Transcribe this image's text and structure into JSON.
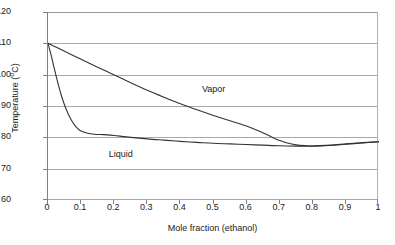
{
  "chart_data": {
    "type": "line",
    "title": "",
    "xlabel": "Mole fraction (ethanol)",
    "ylabel": "Temperature (°C)",
    "ylabel_text": "Temperature (",
    "ylabel_unit_sup": "o",
    "ylabel_tail": "C)",
    "xlim": [
      0,
      1
    ],
    "ylim": [
      60,
      120
    ],
    "grid": true,
    "legend_position": "inline-annotations",
    "xticks": [
      "0",
      "0.1",
      "0.2",
      "0.3",
      "0.4",
      "0.5",
      "0.6",
      "0.7",
      "0.8",
      "0.9",
      "1"
    ],
    "xtick_values": [
      0,
      0.1,
      0.2,
      0.3,
      0.4,
      0.5,
      0.6,
      0.7,
      0.8,
      0.9,
      1
    ],
    "yticks": [
      "60",
      "70",
      "80",
      "90",
      "100",
      "110",
      "120"
    ],
    "ytick_values": [
      60,
      70,
      80,
      90,
      100,
      110,
      120
    ],
    "annotations": [
      {
        "text": "Vapor",
        "x": 0.5,
        "y": 95
      },
      {
        "text": "Liquid",
        "x": 0.22,
        "y": 74.5
      }
    ],
    "series": [
      {
        "name": "Vapor",
        "color": "#333333",
        "x": [
          0.0,
          0.02,
          0.05,
          0.1,
          0.15,
          0.2,
          0.25,
          0.3,
          0.35,
          0.4,
          0.45,
          0.5,
          0.55,
          0.6,
          0.65,
          0.68,
          0.7,
          0.72,
          0.75,
          0.78,
          0.8,
          0.85,
          0.9,
          0.95,
          1.0
        ],
        "y": [
          110.0,
          109.0,
          107.5,
          104.9,
          102.4,
          99.9,
          97.4,
          95.0,
          92.8,
          90.7,
          88.8,
          87.0,
          85.3,
          83.6,
          81.4,
          79.9,
          79.0,
          78.3,
          77.6,
          77.3,
          77.2,
          77.4,
          77.8,
          78.2,
          78.6
        ]
      },
      {
        "name": "Liquid",
        "color": "#333333",
        "x": [
          0.0,
          0.01,
          0.02,
          0.03,
          0.04,
          0.05,
          0.06,
          0.07,
          0.08,
          0.09,
          0.1,
          0.12,
          0.14,
          0.16,
          0.18,
          0.2,
          0.25,
          0.3,
          0.35,
          0.4,
          0.45,
          0.5,
          0.55,
          0.6,
          0.65,
          0.7,
          0.75,
          0.78,
          0.8,
          0.85,
          0.9,
          0.95,
          1.0
        ],
        "y": [
          110.0,
          106.0,
          101.5,
          97.3,
          93.5,
          90.3,
          87.7,
          85.6,
          84.0,
          82.8,
          82.0,
          81.3,
          81.0,
          80.9,
          80.8,
          80.6,
          80.0,
          79.5,
          79.1,
          78.7,
          78.4,
          78.1,
          77.9,
          77.7,
          77.5,
          77.3,
          77.2,
          77.2,
          77.25,
          77.5,
          77.9,
          78.3,
          78.6
        ]
      }
    ]
  },
  "axes": {
    "y_title_prefix": "Temperature (",
    "y_title_sup": "o",
    "y_title_suffix": "C)",
    "x_title": "Mole fraction (ethanol)"
  },
  "labels": {
    "vapor": "Vapor",
    "liquid": "Liquid"
  },
  "colors": {
    "curve": "#333333",
    "gridline": "#a8a8a8",
    "axis": "#808080",
    "text": "#1a1a1a",
    "background": "#ffffff"
  }
}
